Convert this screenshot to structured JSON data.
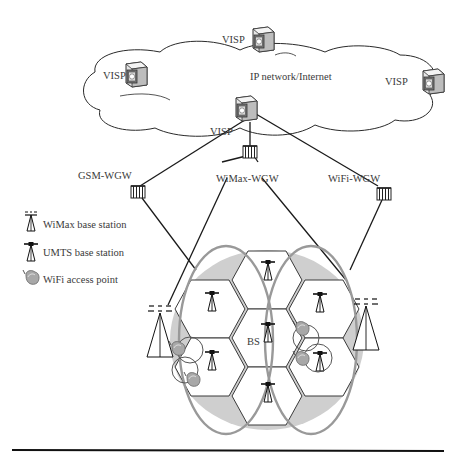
{
  "diagram": {
    "cloud_label": "IP network/Internet",
    "visp_nodes": [
      {
        "id": "visp-top",
        "label": "VISP"
      },
      {
        "id": "visp-left",
        "label": "VISP"
      },
      {
        "id": "visp-right",
        "label": "VISP"
      },
      {
        "id": "visp-bottom",
        "label": "VISP"
      }
    ],
    "gateways": [
      {
        "id": "gsm-wgw",
        "label": "GSM-WGW"
      },
      {
        "id": "wimax-wgw",
        "label": "WiMax-WGW"
      },
      {
        "id": "wifi-wgw",
        "label": "WiFi-WGW"
      }
    ],
    "bs_label": "BS",
    "legend": [
      {
        "icon": "wimax-base-station-icon",
        "label": "WiMax base station"
      },
      {
        "icon": "umts-base-station-icon",
        "label": "UMTS base station"
      },
      {
        "icon": "wifi-access-point-icon",
        "label": "WiFi access point"
      }
    ],
    "colors": {
      "line": "#1a1a1a",
      "coverage_fill": "#cfcfcf",
      "ellipse_stroke": "#999999",
      "device_body": "#d9d9d9",
      "text": "#3a3a3a"
    }
  }
}
